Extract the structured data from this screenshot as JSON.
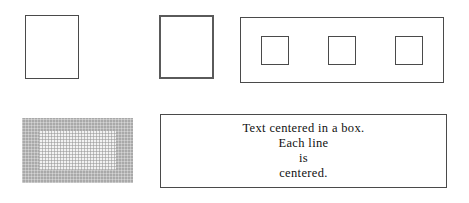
{
  "figure": {
    "background_color": "#ffffff",
    "stroke_color": "#4a4a4a",
    "thick_stroke_color": "#5a5a5a",
    "shade_color": "#a9a9a9",
    "shade_inner_color": "#f2f2f2",
    "text_color": "#111111"
  },
  "shapes": {
    "plain_box": {
      "name": "plain framed box",
      "border_width": "1px",
      "fill": "none"
    },
    "thick_box": {
      "name": "thick ruled box",
      "border_width": "2px",
      "fill": "none"
    },
    "nested_row": {
      "name": "box containing three boxes",
      "border_width": "1px",
      "children": [
        {
          "label": "",
          "name": "nested box 1"
        },
        {
          "label": "",
          "name": "nested box 2"
        },
        {
          "label": "",
          "name": "nested box 3"
        }
      ]
    },
    "shaded_box": {
      "name": "shaded box with lighter inner panel",
      "outer_shade": "#a9a9a9",
      "inner_shade": "#f2f2f2"
    },
    "text_box": {
      "name": "box with centered text",
      "border_width": "1px",
      "alignment": "center",
      "lines": [
        "Text centered in a box.",
        "Each line",
        "is",
        "centered."
      ]
    }
  }
}
